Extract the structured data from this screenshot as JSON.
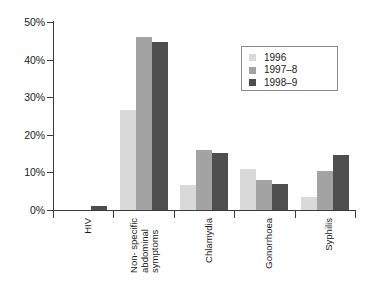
{
  "chart_data": {
    "type": "bar",
    "title": "",
    "subtitle": "",
    "xlabel": "",
    "ylabel": "",
    "ylim": [
      0,
      50
    ],
    "grid": false,
    "legend_position": "top-right",
    "ytick_labels": [
      "50%",
      "40%",
      "30%",
      "20%",
      "10%",
      "0%"
    ],
    "ytick_values": [
      50,
      40,
      30,
      20,
      10,
      0
    ],
    "categories": [
      "HIV",
      "Non- specific\nabdominal\nsymptoms",
      "Chlamydia",
      "Gonorrhoea",
      "Syphilis"
    ],
    "series": [
      {
        "name": "1996",
        "color": "#d9d9d9",
        "values": [
          0,
          26.5,
          6.7,
          11.0,
          3.5
        ]
      },
      {
        "name": "1997–8",
        "color": "#a3a3a3",
        "values": [
          0,
          46.0,
          16.0,
          8.0,
          10.5
        ]
      },
      {
        "name": "1998–9",
        "color": "#4e4e4e",
        "values": [
          1.0,
          44.7,
          15.1,
          7.0,
          14.5
        ]
      }
    ]
  },
  "legend": {
    "items": [
      {
        "label": "1996",
        "color": "#d9d9d9"
      },
      {
        "label": "1997–8",
        "color": "#a3a3a3"
      },
      {
        "label": "1998–9",
        "color": "#4e4e4e"
      }
    ]
  },
  "colors": {
    "axis": "#3a3a3a",
    "text": "#1a1a1a",
    "background": "#ffffff",
    "legend_border": "#8a8a8a"
  }
}
